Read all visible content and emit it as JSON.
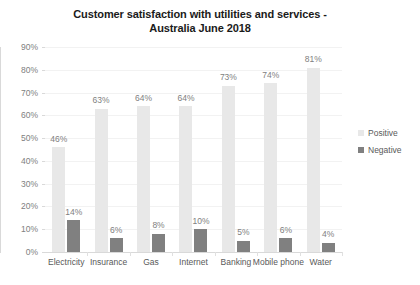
{
  "chart_data": {
    "type": "bar",
    "title": "Customer satisfaction with utilities and services - Australia June 2018",
    "title_line1": "Customer satisfaction with utilities and services -",
    "title_line2": "Australia June 2018",
    "xlabel": "",
    "ylabel": "",
    "ylim": [
      0,
      90
    ],
    "ytick_labels": [
      "90%",
      "80%",
      "70%",
      "60%",
      "50%",
      "40%",
      "30%",
      "20%",
      "10%",
      "0%"
    ],
    "ytick_values": [
      90,
      80,
      70,
      60,
      50,
      40,
      30,
      20,
      10,
      0
    ],
    "grid": true,
    "legend_position": "right",
    "categories": [
      "Electricity",
      "Insurance",
      "Gas",
      "Internet",
      "Banking",
      "Mobile phone",
      "Water"
    ],
    "series": [
      {
        "name": "Positive",
        "color": "#e8e8e8",
        "values": [
          46,
          63,
          64,
          64,
          73,
          74,
          81
        ],
        "labels": [
          "46%",
          "63%",
          "64%",
          "64%",
          "73%",
          "74%",
          "81%"
        ]
      },
      {
        "name": "Negative",
        "color": "#808080",
        "values": [
          14,
          6,
          8,
          10,
          5,
          6,
          4
        ],
        "labels": [
          "14%",
          "6%",
          "8%",
          "10%",
          "5%",
          "6%",
          "4%"
        ]
      }
    ]
  },
  "legend": {
    "items": [
      {
        "label": "Positive",
        "color": "#e8e8e8"
      },
      {
        "label": "Negative",
        "color": "#808080"
      }
    ]
  }
}
